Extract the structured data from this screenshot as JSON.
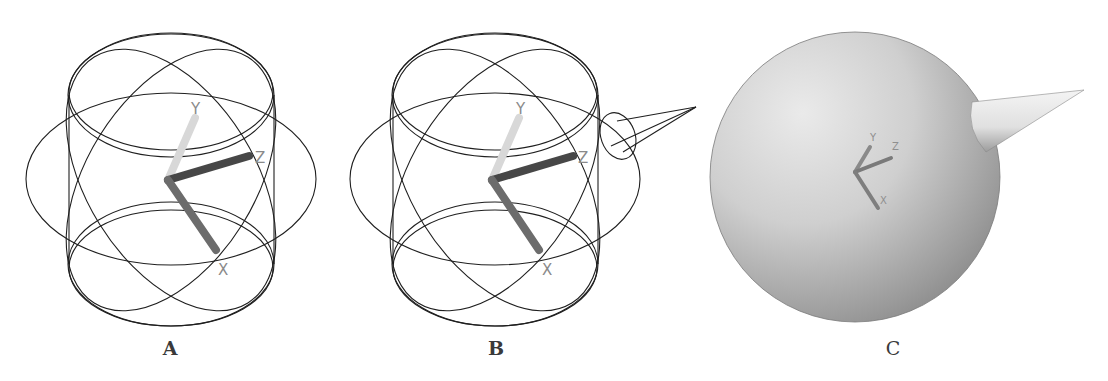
{
  "figure": {
    "panels": [
      {
        "id": "A",
        "label": "A",
        "description": "Wireframe rotate gizmo (gimbal rings) with XYZ axis tripod",
        "axes": {
          "x": "X",
          "y": "Y",
          "z": "Z"
        }
      },
      {
        "id": "B",
        "label": "B",
        "description": "Wireframe rotate gizmo with cone-shaped protrusion on the right",
        "axes": {
          "x": "X",
          "y": "Y",
          "z": "Z"
        }
      },
      {
        "id": "C",
        "label": "C",
        "description": "Shaded sphere with cone spike and small XYZ axis tripod",
        "axes": {
          "x": "X",
          "y": "Y",
          "z": "Z"
        }
      }
    ]
  },
  "colors": {
    "wire": "#1f1f1f",
    "axis_y": "#d4d4d4",
    "axis_z": "#4a4a4a",
    "axis_x": "#6e6e6e",
    "axis_label": "#8a8a8a",
    "sphere_light": "#e2e2e2",
    "sphere_dark": "#8c8c8c",
    "label": "#3a3a3a"
  }
}
